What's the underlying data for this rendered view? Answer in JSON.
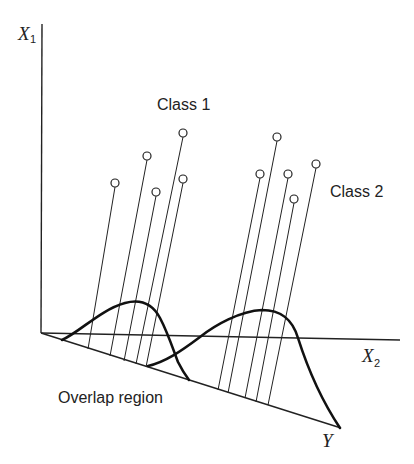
{
  "diagram": {
    "type": "fisher-linear-discriminant-projection",
    "axes": {
      "x1": {
        "label": "X",
        "subscript": "1"
      },
      "x2": {
        "label": "X",
        "subscript": "2"
      },
      "y": {
        "label": "Y"
      }
    },
    "labels": {
      "class1": "Class 1",
      "class2": "Class 2",
      "overlap": "Overlap region"
    },
    "class1_points": [
      {
        "cx": 115,
        "cy": 183,
        "fx": 88,
        "fy": 349
      },
      {
        "cx": 147,
        "cy": 156,
        "fx": 110,
        "fy": 356
      },
      {
        "cx": 156,
        "cy": 192,
        "fx": 124,
        "fy": 361
      },
      {
        "cx": 183,
        "cy": 133,
        "fx": 136,
        "fy": 364
      },
      {
        "cx": 183,
        "cy": 179,
        "fx": 146,
        "fy": 367
      }
    ],
    "class2_points": [
      {
        "cx": 260,
        "cy": 174,
        "fx": 218,
        "fy": 390
      },
      {
        "cx": 277,
        "cy": 137,
        "fx": 228,
        "fy": 393
      },
      {
        "cx": 288,
        "cy": 174,
        "fx": 245,
        "fy": 398
      },
      {
        "cx": 294,
        "cy": 199,
        "fx": 256,
        "fy": 402
      },
      {
        "cx": 316,
        "cy": 164,
        "fx": 268,
        "fy": 405
      }
    ],
    "colors": {
      "ink": "#222222",
      "background": "#ffffff"
    }
  }
}
